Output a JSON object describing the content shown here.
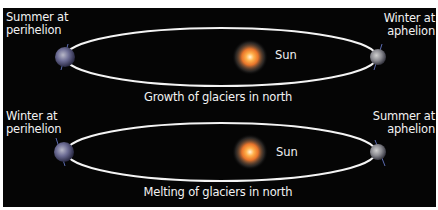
{
  "diagram": {
    "background_color": "#050505",
    "orbit_color": "#ffffff",
    "sun_color": "#f08a2a",
    "earth_color": "#6a6a8a",
    "panels": [
      {
        "id": "top",
        "left_label_line1": "Summer at",
        "left_label_line2": "perihelion",
        "right_label_line1": "Winter at",
        "right_label_line2": "aphelion",
        "sun_label": "Sun",
        "caption": "Growth of glaciers in north"
      },
      {
        "id": "bottom",
        "left_label_line1": "Winter at",
        "left_label_line2": "perihelion",
        "right_label_line1": "Summer at",
        "right_label_line2": "aphelion",
        "sun_label": "Sun",
        "caption": "Melting of glaciers in north"
      }
    ]
  }
}
